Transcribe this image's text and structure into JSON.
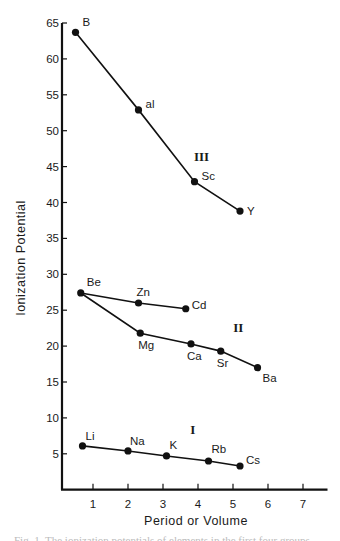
{
  "chart_data": {
    "type": "line",
    "title": "",
    "xlabel": "Period or Volume",
    "ylabel": "Ionization Potential",
    "xlim": [
      0,
      7.5
    ],
    "ylim": [
      0,
      65
    ],
    "x_ticks": [
      1,
      2,
      3,
      4,
      5,
      6,
      7
    ],
    "y_ticks": [
      5,
      10,
      15,
      20,
      25,
      30,
      35,
      40,
      45,
      50,
      55,
      60,
      65
    ],
    "grid": false,
    "legend": null,
    "group_labels": [
      {
        "text": "III",
        "x": 4.1,
        "y": 45.8
      },
      {
        "text": "II",
        "x": 5.15,
        "y": 22.0
      },
      {
        "text": "I",
        "x": 3.85,
        "y": 7.8
      }
    ],
    "series": [
      {
        "name": "Group III",
        "points": [
          {
            "label": "B",
            "x": 0.5,
            "y": 63.7
          },
          {
            "label": "al",
            "x": 2.3,
            "y": 52.9
          },
          {
            "label": "Sc",
            "x": 3.9,
            "y": 42.9
          },
          {
            "label": "Y",
            "x": 5.2,
            "y": 38.8
          }
        ]
      },
      {
        "name": "Group II (Be-Zn-Cd)",
        "points": [
          {
            "label": "Be",
            "x": 0.65,
            "y": 27.4
          },
          {
            "label": "Zn",
            "x": 2.3,
            "y": 26.0
          },
          {
            "label": "Cd",
            "x": 3.65,
            "y": 25.2
          }
        ]
      },
      {
        "name": "Group II (Be-Mg-Ca-Sr-Ba)",
        "points": [
          {
            "label": "Be",
            "x": 0.65,
            "y": 27.4
          },
          {
            "label": "Mg",
            "x": 2.35,
            "y": 21.8
          },
          {
            "label": "Ca",
            "x": 3.8,
            "y": 20.3
          },
          {
            "label": "Sr",
            "x": 4.65,
            "y": 19.3
          },
          {
            "label": "Ba",
            "x": 5.7,
            "y": 17.0
          }
        ]
      },
      {
        "name": "Group I",
        "points": [
          {
            "label": "Li",
            "x": 0.7,
            "y": 6.1
          },
          {
            "label": "Na",
            "x": 2.0,
            "y": 5.4
          },
          {
            "label": "K",
            "x": 3.1,
            "y": 4.7
          },
          {
            "label": "Rb",
            "x": 4.3,
            "y": 4.0
          },
          {
            "label": "Cs",
            "x": 5.2,
            "y": 3.3
          }
        ]
      }
    ],
    "label_offsets": {
      "B": [
        7,
        -6
      ],
      "al": [
        7,
        -2
      ],
      "Sc": [
        7,
        -2
      ],
      "Y": [
        7,
        4
      ],
      "Be": [
        6,
        -7
      ],
      "Zn": [
        -2,
        -7
      ],
      "Cd": [
        6,
        0
      ],
      "Mg": [
        -2,
        16
      ],
      "Ca": [
        -4,
        16
      ],
      "Sr": [
        -4,
        16
      ],
      "Ba": [
        5,
        14
      ],
      "Li": [
        3,
        -6
      ],
      "Na": [
        2,
        -6
      ],
      "K": [
        3,
        -7
      ],
      "Rb": [
        3,
        -8
      ],
      "Cs": [
        6,
        -2
      ]
    }
  },
  "caption": "Fig. 1. The ionization potentials of elements in the first four groups"
}
